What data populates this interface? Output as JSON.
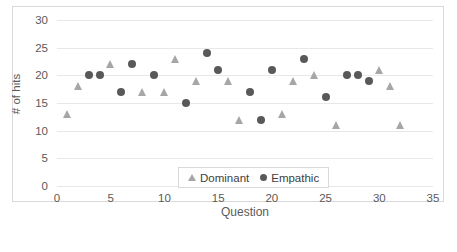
{
  "chart_data": {
    "type": "scatter",
    "title": "",
    "xlabel": "Question",
    "ylabel": "# of hits",
    "xlim": [
      0,
      35
    ],
    "ylim": [
      0,
      30
    ],
    "xticks": [
      0,
      5,
      10,
      15,
      20,
      25,
      30,
      35
    ],
    "yticks": [
      0,
      5,
      10,
      15,
      20,
      25,
      30
    ],
    "grid": "horizontal",
    "legend_position": "inside-bottom-center",
    "series": [
      {
        "name": "Dominant",
        "marker": "triangle",
        "color": "#a6a6a6",
        "points": [
          {
            "x": 1,
            "y": 13
          },
          {
            "x": 2,
            "y": 18
          },
          {
            "x": 5,
            "y": 22
          },
          {
            "x": 8,
            "y": 17
          },
          {
            "x": 10,
            "y": 17
          },
          {
            "x": 11,
            "y": 23
          },
          {
            "x": 13,
            "y": 19
          },
          {
            "x": 16,
            "y": 19
          },
          {
            "x": 17,
            "y": 12
          },
          {
            "x": 21,
            "y": 13
          },
          {
            "x": 22,
            "y": 19
          },
          {
            "x": 24,
            "y": 20
          },
          {
            "x": 26,
            "y": 11
          },
          {
            "x": 30,
            "y": 21
          },
          {
            "x": 31,
            "y": 18
          },
          {
            "x": 32,
            "y": 11
          }
        ]
      },
      {
        "name": "Empathic",
        "marker": "circle",
        "color": "#595959",
        "points": [
          {
            "x": 3,
            "y": 20
          },
          {
            "x": 4,
            "y": 20
          },
          {
            "x": 6,
            "y": 17
          },
          {
            "x": 7,
            "y": 22
          },
          {
            "x": 9,
            "y": 20
          },
          {
            "x": 12,
            "y": 15
          },
          {
            "x": 14,
            "y": 24
          },
          {
            "x": 15,
            "y": 21
          },
          {
            "x": 18,
            "y": 17
          },
          {
            "x": 19,
            "y": 12
          },
          {
            "x": 20,
            "y": 21
          },
          {
            "x": 23,
            "y": 23
          },
          {
            "x": 25,
            "y": 16
          },
          {
            "x": 27,
            "y": 20
          },
          {
            "x": 28,
            "y": 20
          },
          {
            "x": 29,
            "y": 19
          }
        ]
      }
    ]
  },
  "legend": {
    "items": [
      {
        "label": "Dominant",
        "marker": "triangle"
      },
      {
        "label": "Empathic",
        "marker": "circle"
      }
    ]
  }
}
